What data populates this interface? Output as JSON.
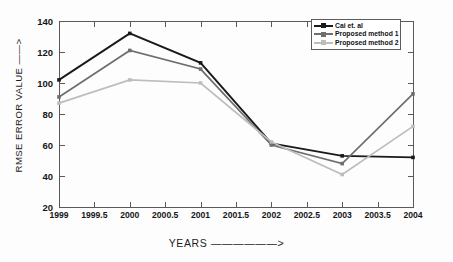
{
  "chart_data": {
    "type": "line",
    "title": "",
    "xlabel": "YEARS ——————>",
    "ylabel": "RMSE ERROR VALUE ——>",
    "x": [
      1999,
      2000,
      2001,
      2002,
      2003,
      2004
    ],
    "xlim": [
      1999,
      2004
    ],
    "ylim": [
      20,
      140
    ],
    "xticks": [
      "1999",
      "1999.5",
      "2000",
      "2000.5",
      "2001",
      "2001.5",
      "2002",
      "2002.5",
      "2003",
      "2003.5",
      "2004"
    ],
    "xtick_values": [
      1999,
      1999.5,
      2000,
      2000.5,
      2001,
      2001.5,
      2002,
      2002.5,
      2003,
      2003.5,
      2004
    ],
    "yticks": [
      "20",
      "40",
      "60",
      "80",
      "100",
      "120",
      "140"
    ],
    "ytick_values": [
      20,
      40,
      60,
      80,
      100,
      120,
      140
    ],
    "grid": false,
    "legend_position": "top-right",
    "series": [
      {
        "name": "Cai et. al",
        "color": "#1a1a1a",
        "marker": "square",
        "values": [
          102,
          132,
          113,
          61,
          53,
          52
        ]
      },
      {
        "name": "Proposed method 1",
        "color": "#6e6e6e",
        "marker": "square",
        "values": [
          91,
          121,
          109,
          60,
          48,
          93
        ]
      },
      {
        "name": "Proposed method 2",
        "color": "#bdbdbd",
        "marker": "square",
        "values": [
          87,
          102,
          100,
          62,
          41,
          72
        ]
      }
    ]
  },
  "axes": {
    "x_title": "YEARS",
    "x_arrow": "——————>",
    "y_title": "RMSE ERROR VALUE",
    "y_arrow": "——>"
  },
  "legend": {
    "items": [
      {
        "label": "Cai et. al",
        "color": "#1a1a1a"
      },
      {
        "label": "Proposed method 1",
        "color": "#6e6e6e"
      },
      {
        "label": "Proposed method 2",
        "color": "#bdbdbd"
      }
    ]
  }
}
